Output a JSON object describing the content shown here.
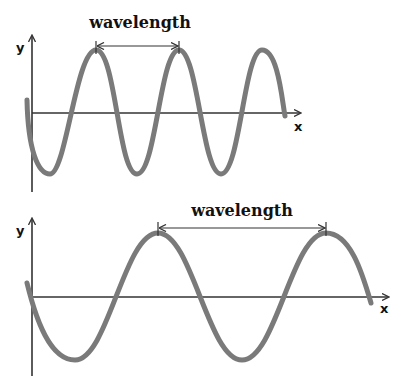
{
  "diagram": {
    "panels": [
      {
        "id": "short-wave",
        "label": "wavelength",
        "y_axis_label": "y",
        "x_axis_label": "x",
        "cycles_shown": 3,
        "wave_color": "#7a7a7a"
      },
      {
        "id": "long-wave",
        "label": "wavelength",
        "y_axis_label": "y",
        "x_axis_label": "x",
        "cycles_shown": 2,
        "wave_color": "#7a7a7a"
      }
    ]
  }
}
